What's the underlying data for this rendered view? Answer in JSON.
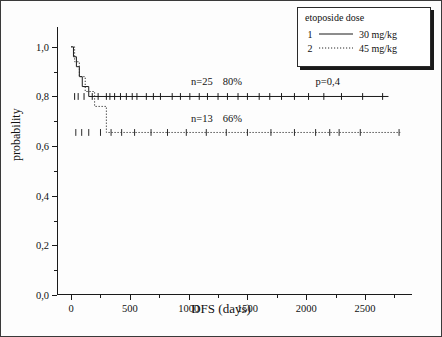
{
  "chart_data": {
    "type": "line",
    "title": "",
    "xlabel": "DFS (days)",
    "ylabel": "probability",
    "xlim": [
      -120,
      2900
    ],
    "ylim": [
      0.0,
      1.08
    ],
    "xticks": [
      0,
      500,
      1000,
      1500,
      2000,
      2500
    ],
    "xtick_labels": [
      "0",
      "500",
      "1000",
      "1500",
      "2000",
      "2500"
    ],
    "yticks": [
      0.0,
      0.2,
      0.4,
      0.6,
      0.8,
      1.0
    ],
    "ytick_labels": [
      "0,0",
      "0,2",
      "0,4",
      "0,6",
      "0,8",
      "1,0"
    ],
    "grid": false,
    "series": [
      {
        "name": "1   30 mg/kg",
        "style": "solid",
        "n": 25,
        "survival_pct": "80%",
        "points": [
          [
            0,
            1.0
          ],
          [
            20,
            1.0
          ],
          [
            20,
            0.96
          ],
          [
            45,
            0.96
          ],
          [
            45,
            0.92
          ],
          [
            70,
            0.92
          ],
          [
            70,
            0.88
          ],
          [
            95,
            0.88
          ],
          [
            95,
            0.84
          ],
          [
            150,
            0.84
          ],
          [
            150,
            0.8
          ],
          [
            2700,
            0.8
          ]
        ],
        "censor_marks": [
          30,
          60,
          110,
          180,
          230,
          300,
          330,
          370,
          420,
          470,
          520,
          560,
          640,
          700,
          760,
          860,
          930,
          1010,
          1090,
          1160,
          1250,
          1330,
          1420,
          1500,
          1600,
          1690,
          1790,
          1900,
          2020,
          2150,
          2300,
          2480,
          2650
        ]
      },
      {
        "name": "2   45 mg/kg",
        "style": "dotted",
        "n": 13,
        "survival_pct": "66%",
        "points": [
          [
            0,
            1.0
          ],
          [
            30,
            1.0
          ],
          [
            30,
            0.94
          ],
          [
            70,
            0.94
          ],
          [
            70,
            0.88
          ],
          [
            120,
            0.88
          ],
          [
            120,
            0.82
          ],
          [
            200,
            0.82
          ],
          [
            200,
            0.76
          ],
          [
            300,
            0.76
          ],
          [
            300,
            0.655
          ],
          [
            2800,
            0.655
          ]
        ],
        "censor_marks": [
          40,
          90,
          150,
          250,
          340,
          430,
          540,
          680,
          820,
          980,
          1150,
          1320,
          1500,
          1700,
          1900,
          2080,
          2200,
          2280,
          2460,
          2790
        ]
      }
    ],
    "annotations": [
      {
        "name": "group1-stats-n",
        "text": "n=25",
        "x": 1020,
        "y": 0.855
      },
      {
        "name": "group1-stats-pct",
        "text": "80%",
        "x": 1290,
        "y": 0.855
      },
      {
        "name": "pvalue",
        "text": "p=0,4",
        "x": 2080,
        "y": 0.855
      },
      {
        "name": "group2-stats-n",
        "text": "n=13",
        "x": 1020,
        "y": 0.705
      },
      {
        "name": "group2-stats-pct",
        "text": "66%",
        "x": 1290,
        "y": 0.705
      }
    ]
  },
  "legend": {
    "title": "etoposide dose",
    "items": [
      {
        "key": "1",
        "label": "30 mg/kg",
        "style": "solid"
      },
      {
        "key": "2",
        "label": "45 mg/kg",
        "style": "dotted"
      }
    ]
  },
  "colors": {
    "axis": "#1a1a1a",
    "curve1": "#1a1a1a",
    "curve2": "#2b2b2b",
    "frame": "#3a3a3a",
    "background": "#fdfdfd"
  }
}
